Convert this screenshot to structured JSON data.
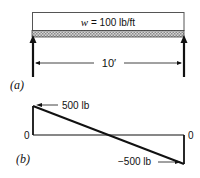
{
  "figure_a": {
    "label": "(a)",
    "load_label": "w = 100 lb/ft",
    "load_symbol": "w",
    "load_value": "= 100 lb/ft",
    "span_label": "10′",
    "supports": [
      "left-reaction-arrow",
      "right-reaction-arrow"
    ]
  },
  "figure_b": {
    "label": "(b)",
    "left_zero": "0",
    "right_zero": "0",
    "max_label": "500 lb",
    "min_label": "−500 lb"
  },
  "colors": {
    "line": "#111111",
    "hatch": "#9a9a9a"
  }
}
